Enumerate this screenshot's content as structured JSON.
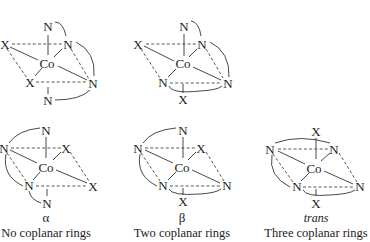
{
  "figure": {
    "center_atom": "Co",
    "isomers": [
      {
        "id": "top-left",
        "atoms": {
          "top": "N",
          "left": "X",
          "upper_right": "N",
          "center": "Co",
          "lower_left": "X",
          "right": "N",
          "bottom": "N"
        }
      },
      {
        "id": "top-middle",
        "atoms": {
          "top": "N",
          "left": "X",
          "upper_right": "N",
          "center": "Co",
          "lower_left": "N",
          "right": "N",
          "bottom": "X"
        }
      },
      {
        "id": "alpha",
        "atoms": {
          "top": "N",
          "left": "N",
          "upper_right": "X",
          "center": "Co",
          "lower_left": "N",
          "right": "X",
          "bottom": "N"
        },
        "label": "α",
        "caption": "No coplanar rings"
      },
      {
        "id": "beta",
        "atoms": {
          "top": "N",
          "left": "N",
          "upper_right": "X",
          "center": "Co",
          "lower_left": "N",
          "right": "N",
          "bottom": "X"
        },
        "label": "β",
        "caption": "Two coplanar rings"
      },
      {
        "id": "trans",
        "atoms": {
          "top": "X",
          "left": "N",
          "upper_right": "N",
          "center": "Co",
          "lower_left": "N",
          "right": "N",
          "bottom": "X"
        },
        "label": "trans",
        "caption": "Three coplanar rings"
      }
    ]
  }
}
